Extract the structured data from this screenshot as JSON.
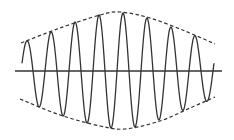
{
  "diagram": {
    "title": "",
    "colors": {
      "background": "#ffffff",
      "wave": "#333333",
      "axis": "#333333",
      "envelope": "#333333"
    },
    "axis": {
      "x1": 15,
      "x2": 222,
      "y": 71
    },
    "wave": {
      "x_start": 22,
      "x_end": 214,
      "center_y": 71,
      "period_px": 24,
      "first_peak_x": 27,
      "peaks": [
        {
          "x": 27,
          "y": 41
        },
        {
          "x": 51,
          "y": 32
        },
        {
          "x": 75,
          "y": 22
        },
        {
          "x": 99,
          "y": 15
        },
        {
          "x": 123,
          "y": 13
        },
        {
          "x": 147,
          "y": 18
        },
        {
          "x": 171,
          "y": 27
        },
        {
          "x": 196,
          "y": 36
        }
      ],
      "troughs": [
        {
          "x": 39,
          "y": 107
        },
        {
          "x": 63,
          "y": 116
        },
        {
          "x": 87,
          "y": 123
        },
        {
          "x": 111,
          "y": 128
        },
        {
          "x": 135,
          "y": 127
        },
        {
          "x": 159,
          "y": 120
        },
        {
          "x": 184,
          "y": 110
        },
        {
          "x": 208,
          "y": 101
        }
      ]
    },
    "envelope_top": [
      {
        "x": 21,
        "y": 43
      },
      {
        "x": 60,
        "y": 28
      },
      {
        "x": 100,
        "y": 15
      },
      {
        "x": 120,
        "y": 12
      },
      {
        "x": 150,
        "y": 18
      },
      {
        "x": 185,
        "y": 31
      },
      {
        "x": 215,
        "y": 44
      }
    ],
    "envelope_bottom": [
      {
        "x": 20,
        "y": 99
      },
      {
        "x": 60,
        "y": 115
      },
      {
        "x": 100,
        "y": 126
      },
      {
        "x": 125,
        "y": 129
      },
      {
        "x": 160,
        "y": 121
      },
      {
        "x": 190,
        "y": 108
      },
      {
        "x": 215,
        "y": 97
      }
    ],
    "labels": []
  }
}
